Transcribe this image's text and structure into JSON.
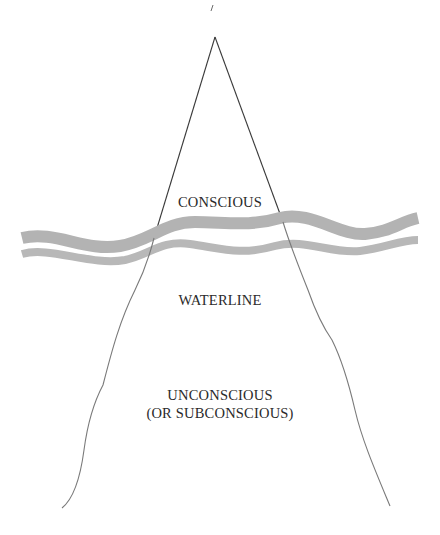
{
  "diagram": {
    "labels": {
      "conscious": "CONSCIOUS",
      "waterline": "WATERLINE",
      "unconscious_line1": "UNCONSCIOUS",
      "unconscious_line2": "(OR SUBCONSCIOUS)"
    },
    "colors": {
      "outline": "#4a4a4a",
      "wave": "#b5b5b5",
      "text": "#2a2a2a",
      "background": "#ffffff"
    }
  }
}
